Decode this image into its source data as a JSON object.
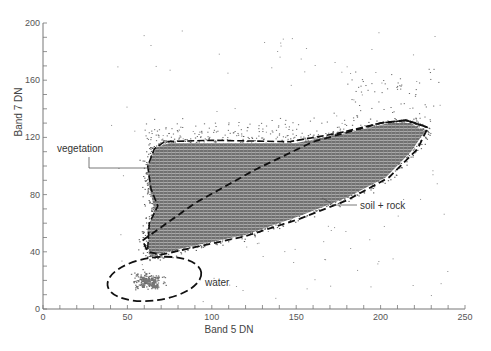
{
  "chart_data": {
    "type": "scatter",
    "title": "",
    "xlabel": "Band 5 DN",
    "ylabel": "Band 7 DN",
    "xlim": [
      0,
      250
    ],
    "ylim": [
      0,
      200
    ],
    "x_ticks": [
      0,
      50,
      100,
      150,
      200,
      250
    ],
    "y_ticks": [
      0,
      40,
      80,
      120,
      160,
      200
    ],
    "minor_tick_step": 10,
    "grid": false,
    "legend": null,
    "annotations": [
      {
        "label": "vegetation",
        "text_at": [
          12,
          113
        ],
        "leader_to": [
          63,
          99
        ]
      },
      {
        "label": "soil + rock",
        "text_at": [
          188,
          74
        ],
        "leader_to": [
          172,
          75
        ]
      },
      {
        "label": "water",
        "text_at": [
          96,
          18
        ],
        "leader_to": null
      }
    ],
    "regions": [
      {
        "name": "vegetation",
        "style": "dashed",
        "description": "Upper-left lobe bounded above by ~117 DN band 7 and on the left by ~62 DN band 5, separated from soil+rock by diagonal dashed line",
        "boundary": [
          [
            62,
            42
          ],
          [
            63,
            60
          ],
          [
            68,
            72
          ],
          [
            64,
            84
          ],
          [
            62,
            100
          ],
          [
            66,
            112
          ],
          [
            72,
            117
          ],
          [
            100,
            118
          ],
          [
            146,
            117
          ],
          [
            175,
            123
          ],
          [
            200,
            130
          ],
          [
            215,
            132
          ],
          [
            228,
            127
          ]
        ]
      },
      {
        "name": "soil + rock",
        "style": "dashed",
        "description": "Elongated diagonal band from ~(60,40) to ~(228,127)",
        "boundary": [
          [
            59,
            48
          ],
          [
            90,
            74
          ],
          [
            125,
            97
          ],
          [
            160,
            117
          ],
          [
            200,
            130
          ],
          [
            215,
            132
          ],
          [
            228,
            127
          ],
          [
            222,
            112
          ],
          [
            205,
            92
          ],
          [
            180,
            76
          ],
          [
            152,
            63
          ],
          [
            120,
            51
          ],
          [
            93,
            44
          ],
          [
            70,
            38
          ],
          [
            62,
            40
          ],
          [
            59,
            48
          ]
        ]
      },
      {
        "name": "water",
        "style": "dashed",
        "description": "Small ellipse cluster at low DN values",
        "ellipse": {
          "cx": 66,
          "cy": 21,
          "rx": 28,
          "ry": 15,
          "angle_deg": -8
        }
      }
    ],
    "point_clusters": [
      {
        "name": "dense core",
        "approx_center": [
          140,
          85
        ],
        "density": "very high"
      },
      {
        "name": "water cluster",
        "approx_center": [
          62,
          18
        ],
        "density": "moderate"
      },
      {
        "name": "sparse outliers",
        "x_range": [
          40,
          240
        ],
        "y_range": [
          5,
          195
        ],
        "density": "low"
      }
    ]
  },
  "labels": {
    "x_axis_title": "Band 5 DN",
    "y_axis_title": "Band 7 DN",
    "vegetation": "vegetation",
    "soil_rock": "soil + rock",
    "water": "water"
  },
  "colors": {
    "axis": "#777777",
    "points": "#555555",
    "dense": "#6e6e6e",
    "boundary": "#111111"
  }
}
